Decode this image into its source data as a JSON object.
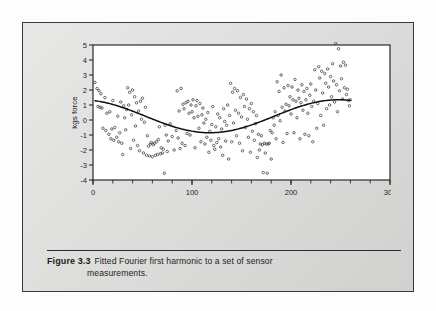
{
  "figure": {
    "label": "Figure 3.3",
    "caption_line1": "Fitted Fourier first harmonic to a set of sensor",
    "caption_line2": "measurements.",
    "panel_bg": "#dcdcda",
    "border_color": "#3a3a3a"
  },
  "chart_data": {
    "type": "scatter",
    "title": "",
    "subtitle": "",
    "xlabel": "Index",
    "ylabel": "kgs force",
    "xlim": [
      0,
      300
    ],
    "ylim": [
      -4,
      5
    ],
    "xticks": [
      0,
      100,
      200,
      300
    ],
    "xtick_labels": [
      "0",
      "100",
      "200",
      "300"
    ],
    "xminor_step": 20,
    "yticks": [
      -4,
      -3,
      -2,
      -1,
      0,
      1,
      2,
      3,
      4,
      5
    ],
    "ytick_labels": [
      "-4",
      "-3",
      "-2",
      "-1",
      "0",
      "1",
      "2",
      "3",
      "4",
      "5"
    ],
    "grid": false,
    "legend": null,
    "marker": "open-circle",
    "marker_color": "#3c3c3c",
    "line_color": "#111111",
    "series": [
      {
        "name": "sensor measurements",
        "type": "scatter",
        "points": [
          [
            2,
            2.5
          ],
          [
            4,
            2.1
          ],
          [
            5,
            0.9
          ],
          [
            6,
            1.95
          ],
          [
            7,
            0.85
          ],
          [
            8,
            1.75
          ],
          [
            9,
            0.8
          ],
          [
            10,
            -0.55
          ],
          [
            12,
            1.5
          ],
          [
            13,
            -0.7
          ],
          [
            14,
            0.45
          ],
          [
            16,
            -0.95
          ],
          [
            17,
            0.55
          ],
          [
            18,
            -1.25
          ],
          [
            19,
            -0.6
          ],
          [
            20,
            1.3
          ],
          [
            21,
            -1.35
          ],
          [
            22,
            -0.5
          ],
          [
            24,
            -1.15
          ],
          [
            25,
            0.25
          ],
          [
            26,
            -1.45
          ],
          [
            27,
            -0.85
          ],
          [
            28,
            1.2
          ],
          [
            29,
            -1.55
          ],
          [
            30,
            -2.3
          ],
          [
            31,
            0.95
          ],
          [
            32,
            0.15
          ],
          [
            33,
            -0.65
          ],
          [
            34,
            0.7
          ],
          [
            35,
            2.15
          ],
          [
            36,
            1.0
          ],
          [
            37,
            1.85
          ],
          [
            38,
            -1.9
          ],
          [
            39,
            0.35
          ],
          [
            40,
            2.0
          ],
          [
            41,
            -1.35
          ],
          [
            42,
            1.55
          ],
          [
            43,
            -0.4
          ],
          [
            44,
            1.15
          ],
          [
            45,
            -1.7
          ],
          [
            46,
            0.6
          ],
          [
            47,
            -2.05
          ],
          [
            48,
            1.25
          ],
          [
            49,
            0.05
          ],
          [
            50,
            1.45
          ],
          [
            51,
            -2.2
          ],
          [
            52,
            -0.15
          ],
          [
            53,
            0.85
          ],
          [
            54,
            -2.35
          ],
          [
            55,
            -1.05
          ],
          [
            56,
            -1.75
          ],
          [
            57,
            -2.4
          ],
          [
            58,
            -1.6
          ],
          [
            59,
            -1.5
          ],
          [
            60,
            -2.45
          ],
          [
            61,
            -1.65
          ],
          [
            62,
            -1.55
          ],
          [
            63,
            -2.35
          ],
          [
            64,
            -1.45
          ],
          [
            65,
            -2.3
          ],
          [
            66,
            -1.3
          ],
          [
            67,
            -0.45
          ],
          [
            68,
            -2.25
          ],
          [
            69,
            -1.85
          ],
          [
            70,
            -2.2
          ],
          [
            71,
            -1.95
          ],
          [
            72,
            -3.55
          ],
          [
            73,
            -0.35
          ],
          [
            74,
            -1.0
          ],
          [
            75,
            -2.1
          ],
          [
            76,
            -1.4
          ],
          [
            78,
            -0.25
          ],
          [
            80,
            -1.1
          ],
          [
            82,
            -2.0
          ],
          [
            84,
            -0.7
          ],
          [
            85,
            1.95
          ],
          [
            86,
            -1.2
          ],
          [
            87,
            0.6
          ],
          [
            88,
            -1.9
          ],
          [
            89,
            2.1
          ],
          [
            90,
            -1.55
          ],
          [
            91,
            1.05
          ],
          [
            92,
            0.75
          ],
          [
            93,
            -1.7
          ],
          [
            94,
            1.15
          ],
          [
            95,
            -0.9
          ],
          [
            96,
            1.25
          ],
          [
            97,
            0.45
          ],
          [
            98,
            -1.0
          ],
          [
            99,
            1.0
          ],
          [
            100,
            0.55
          ],
          [
            101,
            1.35
          ],
          [
            102,
            0.15
          ],
          [
            103,
            -1.85
          ],
          [
            104,
            0.95
          ],
          [
            105,
            1.3
          ],
          [
            106,
            0.25
          ],
          [
            107,
            -0.55
          ],
          [
            108,
            1.1
          ],
          [
            109,
            -1.45
          ],
          [
            110,
            0.35
          ],
          [
            111,
            0.8
          ],
          [
            112,
            -0.2
          ],
          [
            113,
            -1.6
          ],
          [
            114,
            0.05
          ],
          [
            115,
            -1.15
          ],
          [
            116,
            0.5
          ],
          [
            117,
            -2.15
          ],
          [
            118,
            -0.75
          ],
          [
            119,
            -1.35
          ],
          [
            120,
            -0.3
          ],
          [
            121,
            0.9
          ],
          [
            122,
            -1.7
          ],
          [
            123,
            -1.95
          ],
          [
            124,
            -0.45
          ],
          [
            125,
            -1.5
          ],
          [
            126,
            0.4
          ],
          [
            127,
            -1.25
          ],
          [
            128,
            0.15
          ],
          [
            129,
            -1.8
          ],
          [
            130,
            -0.6
          ],
          [
            131,
            -2.35
          ],
          [
            132,
            0.75
          ],
          [
            133,
            -0.1
          ],
          [
            134,
            -1.4
          ],
          [
            135,
            -0.35
          ],
          [
            136,
            1.0
          ],
          [
            137,
            -2.6
          ],
          [
            138,
            0.3
          ],
          [
            139,
            2.45
          ],
          [
            140,
            -1.45
          ],
          [
            141,
            1.85
          ],
          [
            142,
            -0.2
          ],
          [
            143,
            2.1
          ],
          [
            144,
            0.65
          ],
          [
            145,
            -1.05
          ],
          [
            146,
            1.95
          ],
          [
            147,
            0.45
          ],
          [
            148,
            -1.55
          ],
          [
            149,
            1.5
          ],
          [
            150,
            0.2
          ],
          [
            151,
            -2.05
          ],
          [
            152,
            1.7
          ],
          [
            153,
            0.9
          ],
          [
            154,
            -0.5
          ],
          [
            155,
            1.4
          ],
          [
            156,
            0.05
          ],
          [
            157,
            -1.15
          ],
          [
            158,
            0.75
          ],
          [
            159,
            -2.15
          ],
          [
            160,
            1.1
          ],
          [
            161,
            -0.75
          ],
          [
            162,
            0.55
          ],
          [
            163,
            -1.35
          ],
          [
            164,
            -0.25
          ],
          [
            165,
            0.3
          ],
          [
            166,
            -2.5
          ],
          [
            167,
            -0.95
          ],
          [
            168,
            -2.0
          ],
          [
            169,
            -1.6
          ],
          [
            170,
            -1.05
          ],
          [
            171,
            -1.65
          ],
          [
            172,
            -3.5
          ],
          [
            173,
            -1.55
          ],
          [
            174,
            -2.2
          ],
          [
            175,
            -1.6
          ],
          [
            176,
            -3.55
          ],
          [
            177,
            -1.6
          ],
          [
            178,
            -1.55
          ],
          [
            179,
            -0.7
          ],
          [
            180,
            -2.6
          ],
          [
            181,
            -0.85
          ],
          [
            182,
            0.15
          ],
          [
            183,
            -0.35
          ],
          [
            184,
            0.55
          ],
          [
            185,
            -1.25
          ],
          [
            186,
            2.55
          ],
          [
            187,
            0.3
          ],
          [
            188,
            1.9
          ],
          [
            189,
            -0.05
          ],
          [
            190,
            3.0
          ],
          [
            191,
            0.85
          ],
          [
            192,
            -1.5
          ],
          [
            193,
            2.15
          ],
          [
            194,
            0.6
          ],
          [
            195,
            1.05
          ],
          [
            196,
            -0.9
          ],
          [
            197,
            2.3
          ],
          [
            198,
            0.95
          ],
          [
            199,
            1.55
          ],
          [
            200,
            0.4
          ],
          [
            201,
            2.2
          ],
          [
            202,
            1.35
          ],
          [
            203,
            -0.85
          ],
          [
            204,
            2.7
          ],
          [
            205,
            1.25
          ],
          [
            206,
            0.15
          ],
          [
            207,
            2.0
          ],
          [
            208,
            1.45
          ],
          [
            209,
            -1.25
          ],
          [
            210,
            1.15
          ],
          [
            211,
            2.35
          ],
          [
            212,
            0.65
          ],
          [
            213,
            1.9
          ],
          [
            214,
            -0.95
          ],
          [
            215,
            1.35
          ],
          [
            216,
            2.1
          ],
          [
            217,
            0.45
          ],
          [
            218,
            -1.05
          ],
          [
            219,
            1.65
          ],
          [
            220,
            2.4
          ],
          [
            221,
            0.9
          ],
          [
            222,
            -1.45
          ],
          [
            223,
            1.25
          ],
          [
            224,
            3.35
          ],
          [
            225,
            2.0
          ],
          [
            226,
            -0.55
          ],
          [
            227,
            1.1
          ],
          [
            228,
            3.55
          ],
          [
            229,
            2.8
          ],
          [
            230,
            0.3
          ],
          [
            231,
            3.25
          ],
          [
            232,
            1.8
          ],
          [
            233,
            -0.35
          ],
          [
            234,
            3.1
          ],
          [
            235,
            2.45
          ],
          [
            236,
            0.75
          ],
          [
            237,
            3.4
          ],
          [
            238,
            2.2
          ],
          [
            239,
            1.0
          ],
          [
            240,
            2.9
          ],
          [
            241,
            1.55
          ],
          [
            242,
            3.75
          ],
          [
            243,
            2.6
          ],
          [
            244,
            1.2
          ],
          [
            245,
            5.1
          ],
          [
            246,
            2.35
          ],
          [
            247,
            0.55
          ],
          [
            248,
            4.75
          ],
          [
            249,
            1.95
          ],
          [
            250,
            3.6
          ],
          [
            251,
            2.75
          ],
          [
            252,
            1.4
          ],
          [
            253,
            3.85
          ],
          [
            254,
            2.15
          ],
          [
            255,
            3.65
          ],
          [
            256,
            1.7
          ],
          [
            257,
            2.05
          ],
          [
            258,
            1.3
          ],
          [
            259,
            0.95
          ],
          [
            260,
            1.35
          ]
        ]
      },
      {
        "name": "fitted Fourier first harmonic",
        "type": "line",
        "description": "cosine first harmonic fit",
        "amplitude": 1.1,
        "mean": 0.25,
        "period": 260,
        "phase_min_index": 118,
        "start_point": [
          2,
          0.85
        ],
        "min_point": [
          118,
          -0.85
        ],
        "max_point": [
          245,
          1.35
        ],
        "end_point": [
          261,
          1.25
        ]
      }
    ]
  }
}
